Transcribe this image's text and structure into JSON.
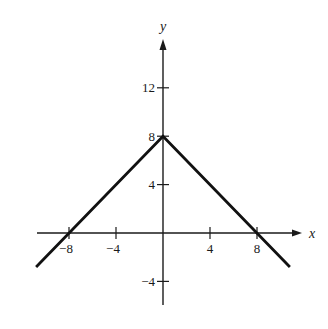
{
  "chart_data": {
    "type": "line",
    "title": "",
    "xlabel": "x",
    "ylabel": "y",
    "xlim": [
      -11,
      11.5
    ],
    "ylim": [
      -6,
      16
    ],
    "grid": false,
    "legend": null,
    "x_ticks": [
      -8,
      -4,
      4,
      8
    ],
    "x_tick_labels": [
      "−8",
      "−4",
      "4",
      "8"
    ],
    "y_ticks": [
      12,
      8,
      4,
      -4
    ],
    "y_tick_labels": [
      "12",
      "8",
      "4",
      "−4"
    ],
    "series": [
      {
        "name": "y = 8 - |x|",
        "x": [
          -10.8,
          0,
          10.8
        ],
        "y": [
          -2.8,
          8,
          -2.8
        ]
      }
    ],
    "annotations": []
  },
  "labels": {
    "x_axis": "x",
    "y_axis": "y"
  }
}
